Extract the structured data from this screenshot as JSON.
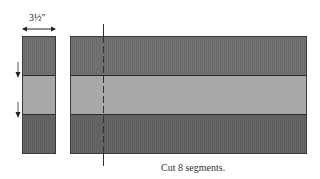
{
  "diagram": {
    "dimension_label": "3½″",
    "caption": "Cut 8 segments.",
    "colors": {
      "dark_band": "#6e6e6e",
      "light_band": "#a8a8a8",
      "bottom_band": "#636363",
      "outline": "#3a3a3a",
      "cut_line": "#333333"
    },
    "strip_set": {
      "bands": [
        "dark",
        "light",
        "dark"
      ]
    },
    "segment": {
      "bands": [
        "dark",
        "light",
        "dark"
      ]
    }
  }
}
